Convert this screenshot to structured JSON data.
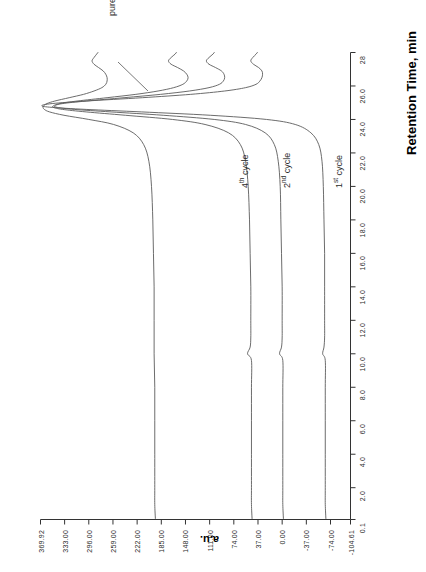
{
  "figure": {
    "kind": "chromatogram",
    "orientation": "rotated-90-clockwise",
    "trace_color": "#5b5b5b",
    "axis_color": "#333333"
  },
  "axes": {
    "x": {
      "title": "Retention Time, min",
      "tick_labels": [
        "0.1",
        "2.0",
        "4.0",
        "6.0",
        "8.0",
        "10.0",
        "12.0",
        "14.0",
        "16.0",
        "18.0",
        "20.0",
        "22.0",
        "24.0",
        "26.0",
        "28"
      ],
      "tick_values": [
        0.1,
        2.0,
        4.0,
        6.0,
        8.0,
        10.0,
        12.0,
        14.0,
        16.0,
        18.0,
        20.0,
        22.0,
        24.0,
        26.0,
        28.0
      ],
      "min": 0.1,
      "max": 28.0
    },
    "y": {
      "title": "a.u.",
      "tick_labels": [
        "369.92",
        "333.00",
        "296.00",
        "259.00",
        "222.00",
        "185.00",
        "148.00",
        "111.00",
        "74.00",
        "37.00",
        "0.00",
        "-37.00",
        "-74.00",
        "-104.61"
      ],
      "tick_values": [
        369.92,
        333.0,
        296.0,
        259.0,
        222.0,
        185.0,
        148.0,
        111.0,
        74.0,
        37.0,
        0.0,
        -37.0,
        -74.0,
        -104.61
      ],
      "min": -104.61,
      "max": 369.92
    }
  },
  "annotations": [
    {
      "id": "pure-thf",
      "text": "pure THF"
    },
    {
      "id": "cycle-4",
      "text_prefix": "4",
      "text_sup": "th",
      "text_suffix": " cycle",
      "full": "4th cycle"
    },
    {
      "id": "cycle-2",
      "text_prefix": "2",
      "text_sup": "nd",
      "text_suffix": " cycle",
      "full": "2nd cycle"
    },
    {
      "id": "cycle-1",
      "text_prefix": "1",
      "text_sup": "st",
      "text_suffix": " cycle",
      "full": "1st cycle"
    }
  ],
  "chart_data": {
    "type": "line",
    "title": "",
    "xlabel": "Retention Time, min",
    "ylabel": "a.u.",
    "xlim": [
      0.1,
      28.0
    ],
    "ylim": [
      -104.61,
      369.92
    ],
    "grid": false,
    "legend": "in-plot annotations",
    "series": [
      {
        "name": "1st cycle",
        "baseline": -65,
        "points": [
          [
            0.1,
            -67
          ],
          [
            1.0,
            -66
          ],
          [
            2.0,
            -66
          ],
          [
            4.0,
            -66
          ],
          [
            6.0,
            -66
          ],
          [
            8.0,
            -66
          ],
          [
            9.6,
            -66
          ],
          [
            10.0,
            -62
          ],
          [
            10.4,
            -64
          ],
          [
            11.0,
            -65
          ],
          [
            12.0,
            -65
          ],
          [
            14.0,
            -65
          ],
          [
            16.0,
            -65
          ],
          [
            18.0,
            -64
          ],
          [
            20.0,
            -63
          ],
          [
            21.5,
            -61
          ],
          [
            22.5,
            -56
          ],
          [
            23.2,
            -44
          ],
          [
            23.7,
            -20
          ],
          [
            24.0,
            24
          ],
          [
            24.25,
            110
          ],
          [
            24.45,
            215
          ],
          [
            24.6,
            300
          ],
          [
            24.72,
            352
          ],
          [
            24.82,
            368
          ],
          [
            24.95,
            352
          ],
          [
            25.1,
            300
          ],
          [
            25.3,
            214
          ],
          [
            25.5,
            140
          ],
          [
            25.7,
            88
          ],
          [
            25.9,
            56
          ],
          [
            26.1,
            40
          ],
          [
            26.3,
            34
          ],
          [
            26.5,
            31
          ],
          [
            26.7,
            30
          ],
          [
            26.9,
            31
          ],
          [
            27.1,
            36
          ],
          [
            27.3,
            44
          ],
          [
            27.5,
            48
          ],
          [
            27.7,
            45
          ],
          [
            27.9,
            40
          ],
          [
            28.0,
            38
          ]
        ]
      },
      {
        "name": "2nd cycle",
        "baseline": 0,
        "points": [
          [
            0.1,
            -2
          ],
          [
            1.0,
            -1
          ],
          [
            2.0,
            -1
          ],
          [
            4.0,
            -1
          ],
          [
            6.0,
            -1
          ],
          [
            8.0,
            -1
          ],
          [
            9.6,
            -1
          ],
          [
            10.0,
            4
          ],
          [
            10.4,
            1
          ],
          [
            11.0,
            0
          ],
          [
            12.0,
            0
          ],
          [
            14.0,
            0
          ],
          [
            16.0,
            1
          ],
          [
            18.0,
            2
          ],
          [
            20.0,
            3
          ],
          [
            21.5,
            6
          ],
          [
            22.5,
            12
          ],
          [
            23.2,
            26
          ],
          [
            23.7,
            56
          ],
          [
            24.0,
            104
          ],
          [
            24.25,
            182
          ],
          [
            24.45,
            262
          ],
          [
            24.6,
            318
          ],
          [
            24.72,
            344
          ],
          [
            24.82,
            348
          ],
          [
            24.95,
            336
          ],
          [
            25.1,
            300
          ],
          [
            25.3,
            242
          ],
          [
            25.5,
            186
          ],
          [
            25.7,
            142
          ],
          [
            25.9,
            112
          ],
          [
            26.1,
            96
          ],
          [
            26.3,
            90
          ],
          [
            26.5,
            88
          ],
          [
            26.7,
            89
          ],
          [
            26.9,
            93
          ],
          [
            27.1,
            102
          ],
          [
            27.3,
            112
          ],
          [
            27.5,
            116
          ],
          [
            27.7,
            112
          ],
          [
            27.9,
            106
          ],
          [
            28.0,
            104
          ]
        ]
      },
      {
        "name": "4th cycle",
        "baseline": 48,
        "points": [
          [
            0.1,
            46
          ],
          [
            1.0,
            47
          ],
          [
            2.0,
            47
          ],
          [
            4.0,
            47
          ],
          [
            6.0,
            47
          ],
          [
            8.0,
            47
          ],
          [
            9.6,
            47
          ],
          [
            10.0,
            53
          ],
          [
            10.4,
            49
          ],
          [
            11.0,
            48
          ],
          [
            12.0,
            48
          ],
          [
            14.0,
            48
          ],
          [
            16.0,
            49
          ],
          [
            18.0,
            50
          ],
          [
            20.0,
            52
          ],
          [
            21.5,
            56
          ],
          [
            22.5,
            64
          ],
          [
            23.2,
            82
          ],
          [
            23.7,
            118
          ],
          [
            24.0,
            168
          ],
          [
            24.25,
            240
          ],
          [
            24.45,
            300
          ],
          [
            24.6,
            336
          ],
          [
            24.72,
            350
          ],
          [
            24.82,
            350
          ],
          [
            24.95,
            340
          ],
          [
            25.1,
            314
          ],
          [
            25.3,
            268
          ],
          [
            25.5,
            224
          ],
          [
            25.7,
            190
          ],
          [
            25.9,
            166
          ],
          [
            26.1,
            152
          ],
          [
            26.3,
            146
          ],
          [
            26.5,
            144
          ],
          [
            26.7,
            146
          ],
          [
            26.9,
            151
          ],
          [
            27.1,
            160
          ],
          [
            27.3,
            170
          ],
          [
            27.5,
            174
          ],
          [
            27.7,
            170
          ],
          [
            27.9,
            164
          ],
          [
            28.0,
            162
          ]
        ]
      },
      {
        "name": "pure THF",
        "baseline": 196,
        "points": [
          [
            0.1,
            194
          ],
          [
            1.0,
            195
          ],
          [
            2.0,
            195
          ],
          [
            4.0,
            195
          ],
          [
            6.0,
            195
          ],
          [
            8.0,
            195
          ],
          [
            10.0,
            196
          ],
          [
            12.0,
            196
          ],
          [
            14.0,
            196
          ],
          [
            16.0,
            197
          ],
          [
            18.0,
            198
          ],
          [
            20.0,
            200
          ],
          [
            21.5,
            204
          ],
          [
            22.5,
            212
          ],
          [
            23.2,
            228
          ],
          [
            23.7,
            258
          ],
          [
            24.0,
            296
          ],
          [
            24.25,
            334
          ],
          [
            24.45,
            356
          ],
          [
            24.6,
            364
          ],
          [
            24.72,
            366
          ],
          [
            24.82,
            365
          ],
          [
            24.95,
            360
          ],
          [
            25.1,
            348
          ],
          [
            25.3,
            326
          ],
          [
            25.5,
            304
          ],
          [
            25.7,
            288
          ],
          [
            25.9,
            276
          ],
          [
            26.1,
            270
          ],
          [
            26.3,
            268
          ],
          [
            26.5,
            268
          ],
          [
            26.7,
            270
          ],
          [
            26.9,
            274
          ],
          [
            27.1,
            281
          ],
          [
            27.3,
            288
          ],
          [
            27.5,
            291
          ],
          [
            27.7,
            288
          ],
          [
            27.9,
            284
          ],
          [
            28.0,
            282
          ]
        ]
      }
    ]
  }
}
